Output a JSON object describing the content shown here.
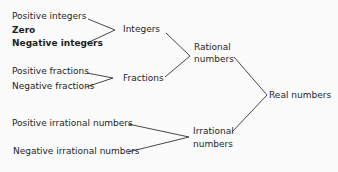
{
  "diagram": {
    "leaves": {
      "positive_integers": "Positive integers",
      "zero": "Zero",
      "negative_integers": "Negative integers",
      "positive_fractions": "Positive fractions",
      "negative_fractions": "Negative fractions",
      "positive_irrational": "Positive irrational numbers",
      "negative_irrational": "Negative irrational numbers"
    },
    "intermediate": {
      "integers": "Integers",
      "fractions": "Fractions",
      "rational_line1": "Rational",
      "rational_line2": "numbers",
      "irrational_line1": "Irrational",
      "irrational_line2": "numbers"
    },
    "root": {
      "real_numbers": "Real numbers"
    },
    "edges": [
      [
        "Positive integers",
        "Integers"
      ],
      [
        "Zero",
        "Integers"
      ],
      [
        "Negative integers",
        "Integers"
      ],
      [
        "Positive fractions",
        "Fractions"
      ],
      [
        "Negative fractions",
        "Fractions"
      ],
      [
        "Integers",
        "Rational numbers"
      ],
      [
        "Fractions",
        "Rational numbers"
      ],
      [
        "Positive irrational numbers",
        "Irrational numbers"
      ],
      [
        "Negative irrational numbers",
        "Irrational numbers"
      ],
      [
        "Rational numbers",
        "Real numbers"
      ],
      [
        "Irrational numbers",
        "Real numbers"
      ]
    ],
    "colors": {
      "text": "#1e1e1e",
      "line": "#333333",
      "background": "#fbfbfb"
    }
  }
}
